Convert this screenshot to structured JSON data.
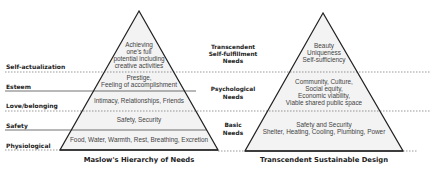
{
  "colors": {
    "line": "#222222",
    "fill": "#f3f3f3",
    "text": "#222222",
    "inner_text": "#444444"
  },
  "left_pyramid": {
    "title": "Maslow's Hierarchy of Needs",
    "levels": [
      {
        "label": "Self-actualization",
        "lines": [
          "Achieving",
          "one's full",
          "potential including",
          "creative activities"
        ]
      },
      {
        "label": "Esteem",
        "lines": [
          "Prestige,",
          "Feeling of accomplishment"
        ]
      },
      {
        "label": "Love/belonging",
        "lines": [
          "Intimacy, Relationships, Friends"
        ]
      },
      {
        "label": "Safety",
        "lines": [
          "Safety, Security"
        ]
      },
      {
        "label": "Physiological",
        "lines": [
          "Food, Water, Warmth, Rest, Breathing, Excretion"
        ]
      }
    ]
  },
  "middle_labels": [
    {
      "lines": [
        "Transcendent",
        "Self-fulfillment",
        "Needs"
      ]
    },
    {
      "lines": [
        "Psychological",
        "Needs"
      ]
    },
    {
      "lines": [
        "Basic",
        "Needs"
      ]
    }
  ],
  "right_pyramid": {
    "title": "Transcendent Sustainable Design",
    "levels": [
      {
        "lines": [
          "Beauty",
          "Uniqueness",
          "Self-sufficiency"
        ]
      },
      {
        "lines": [
          "Community, Culture,",
          "Social equity,",
          "Economic viability,",
          "Viable shared public space"
        ]
      },
      {
        "lines": [
          "Safety and Security",
          "Shelter, Heating, Cooling, Plumbing, Power"
        ]
      }
    ]
  }
}
